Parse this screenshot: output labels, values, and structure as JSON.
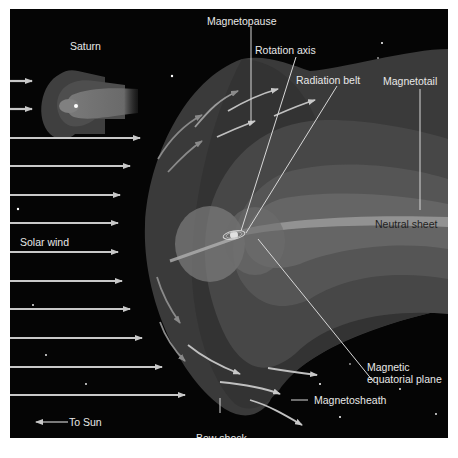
{
  "diagram": {
    "background_color": "#050505",
    "labels": {
      "saturn": "Saturn",
      "magnetopause": "Magnetopause",
      "rotation_axis": "Rotation axis",
      "radiation_belt": "Radiation belt",
      "magnetotail": "Magnetotail",
      "neutral_sheet": "Neutral sheet",
      "solar_wind": "Solar wind",
      "magnetic_equatorial_plane_line1": "Magnetic",
      "magnetic_equatorial_plane_line2": "equatorial plane",
      "magnetosheath": "Magnetosheath",
      "bow_shock": "Bow shock",
      "to_sun": "To Sun"
    },
    "colors": {
      "bow_shock_region": "#3a3a3a",
      "magnetosheath_region": "#2e2e2e",
      "magnetosphere_outer": "#474747",
      "magnetosphere_mid": "#575757",
      "magnetosphere_inner": "#6a6a6a",
      "neutral_sheet_band": "#9a9a9a",
      "arrow_color": "#c8c8c8",
      "label_color": "#e8e8e8",
      "leader_line_color": "#d8d8d8"
    },
    "solar_wind_arrows": 12
  }
}
